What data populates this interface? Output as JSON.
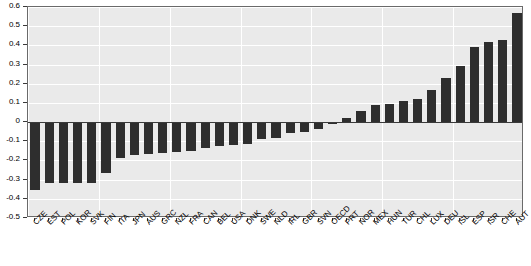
{
  "chart_data": {
    "type": "bar",
    "title": "",
    "subtitle": "",
    "xlabel": "",
    "ylabel": "",
    "grid": true,
    "legend": null,
    "ylim": [
      -0.5,
      0.6
    ],
    "ytick_labels": [
      "0.6",
      "0.5",
      "0.4",
      "0.3",
      "0.2",
      "0.1",
      "0",
      "-0.1",
      "-0.2",
      "-0.3",
      "-0.4",
      "-0.5"
    ],
    "ytick_values": [
      0.6,
      0.5,
      0.4,
      0.3,
      0.2,
      0.1,
      0,
      -0.1,
      -0.2,
      -0.3,
      -0.4,
      -0.5
    ],
    "bar_color": "#2e2e2e",
    "plot_background": "#eaeaea",
    "categories": [
      "CZE",
      "EST",
      "POL",
      "KOR",
      "SVK",
      "FIN",
      "ITA",
      "JPN",
      "AUS",
      "GRC",
      "NZL",
      "FRA",
      "CAN",
      "BEL",
      "USA",
      "DNK",
      "SWE",
      "NLD",
      "IRL",
      "GBR",
      "SVN",
      "OECD",
      "PRT",
      "NOR",
      "MEX",
      "HUN",
      "TUR",
      "CHL",
      "LUX",
      "DEU",
      "ISL",
      "ESP",
      "ISR",
      "CHE",
      "AUT"
    ],
    "values": [
      -0.355,
      -0.32,
      -0.32,
      -0.315,
      -0.32,
      -0.265,
      -0.185,
      -0.17,
      -0.165,
      -0.16,
      -0.155,
      -0.15,
      -0.135,
      -0.125,
      -0.12,
      -0.115,
      -0.09,
      -0.085,
      -0.055,
      -0.05,
      -0.035,
      -0.01,
      0.02,
      0.06,
      0.09,
      0.095,
      0.11,
      0.12,
      0.165,
      0.23,
      0.295,
      0.39,
      0.42,
      0.43,
      0.57
    ]
  }
}
